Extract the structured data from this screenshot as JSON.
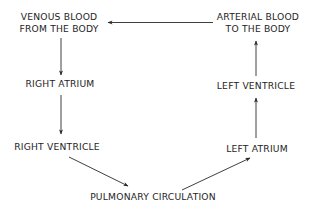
{
  "diagram": {
    "type": "flow-cycle",
    "nodes": {
      "venous": {
        "line1": "VENOUS BLOOD",
        "line2": "FROM THE BODY"
      },
      "arterial": {
        "line1": "ARTERIAL BLOOD",
        "line2": "TO THE BODY"
      },
      "right_atrium": {
        "label": "RIGHT ATRIUM"
      },
      "right_ventricle": {
        "label": "RIGHT VENTRICLE"
      },
      "pulmonary": {
        "label": "PULMONARY CIRCULATION"
      },
      "left_atrium": {
        "label": "LEFT ATRIUM"
      },
      "left_ventricle": {
        "label": "LEFT VENTRICLE"
      }
    },
    "edges": [
      {
        "from": "VENOUS BLOOD FROM THE BODY",
        "to": "RIGHT ATRIUM"
      },
      {
        "from": "RIGHT ATRIUM",
        "to": "RIGHT VENTRICLE"
      },
      {
        "from": "RIGHT VENTRICLE",
        "to": "PULMONARY CIRCULATION"
      },
      {
        "from": "PULMONARY CIRCULATION",
        "to": "LEFT ATRIUM"
      },
      {
        "from": "LEFT ATRIUM",
        "to": "LEFT VENTRICLE"
      },
      {
        "from": "LEFT VENTRICLE",
        "to": "ARTERIAL BLOOD TO THE BODY"
      },
      {
        "from": "ARTERIAL BLOOD TO THE BODY",
        "to": "VENOUS BLOOD FROM THE BODY"
      }
    ],
    "colors": {
      "text": "#1e1e1e",
      "line": "#2a2a2a",
      "background": "#ffffff"
    }
  }
}
